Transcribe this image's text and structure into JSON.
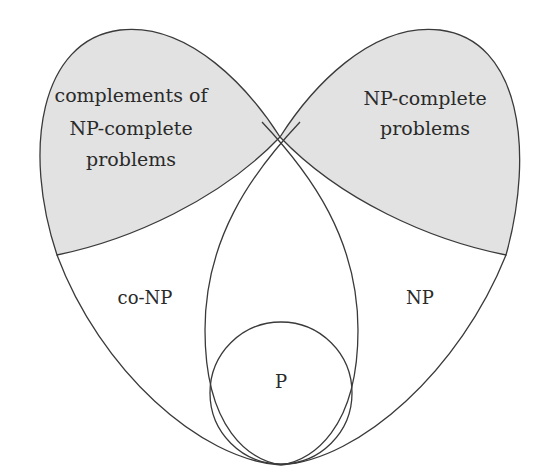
{
  "diagram": {
    "title": "",
    "colors": {
      "stroke": "#3a3a3a",
      "shaded": "#e2e2e2",
      "background": "#ffffff",
      "text": "#2a2a2a"
    },
    "regions": {
      "co_np_complete": {
        "label_lines": [
          "complements of",
          "NP-complete",
          "problems"
        ]
      },
      "np_complete": {
        "label_lines": [
          "NP-complete",
          "problems"
        ]
      },
      "co_np": {
        "label": "co-NP"
      },
      "np": {
        "label": "NP"
      },
      "p": {
        "label": "P"
      }
    }
  }
}
